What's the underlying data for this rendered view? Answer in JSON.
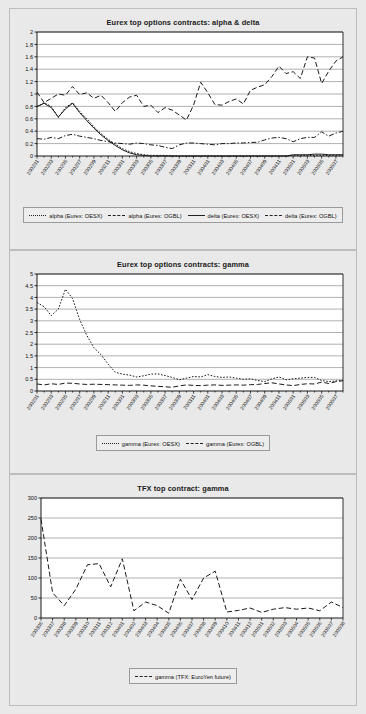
{
  "page": {
    "background": "#e9e9e9",
    "axis_color": "#000000",
    "grid_color": "#808080"
  },
  "figures": [
    {
      "id": "fig1",
      "title": "Eurex top options contracts: alpha & delta",
      "legend": [
        {
          "label": "alpha (Eurex: OESX)",
          "style": "dotted"
        },
        {
          "label": "alpha (Eurex: OGBL)",
          "style": "dashed"
        },
        {
          "label": "delta (Eurex: OESX)",
          "style": "solid"
        },
        {
          "label": "delta (Eurex: OGBL)",
          "style": "dashdot"
        }
      ],
      "chart_data": {
        "type": "line",
        "title": "Eurex top options contracts: alpha & delta",
        "xlabel": "",
        "ylabel": "",
        "ylim": [
          0,
          2
        ],
        "ytick_step": 0.2,
        "yticks": [
          0,
          0.2,
          0.4,
          0.6,
          0.8,
          1,
          1.2,
          1.4,
          1.6,
          1.8,
          2
        ],
        "grid": true,
        "legend_position": "bottom",
        "x": [
          "200201",
          "200202",
          "200203",
          "200204",
          "200205",
          "200206",
          "200207",
          "200208",
          "200209",
          "200210",
          "200211",
          "200212",
          "200301",
          "200302",
          "200303",
          "200304",
          "200305",
          "200306",
          "200307",
          "200308",
          "200309",
          "200310",
          "200311",
          "200312",
          "200401",
          "200402",
          "200403",
          "200404",
          "200405",
          "200406",
          "200407",
          "200408",
          "200409",
          "200410",
          "200411",
          "200412",
          "200501",
          "200502",
          "200503",
          "200504",
          "200505",
          "200506",
          "200507",
          "200508"
        ],
        "xticks": [
          "200201",
          "200203",
          "200205",
          "200207",
          "200209",
          "200211",
          "200301",
          "200303",
          "200305",
          "200307",
          "200309",
          "200311",
          "200401",
          "200403",
          "200405",
          "200407",
          "200409",
          "200411",
          "200501",
          "200503",
          "200505",
          "200507"
        ],
        "series": [
          {
            "name": "alpha (Eurex: OESX)",
            "style": "dotted",
            "values": [
              0.79,
              0.86,
              0.8,
              0.62,
              0.78,
              0.86,
              0.72,
              0.6,
              0.47,
              0.36,
              0.27,
              0.19,
              0.12,
              0.07,
              0.04,
              0.02,
              0.01,
              0.01,
              0.01,
              0.0,
              0.0,
              0.0,
              0.0,
              0.0,
              0.0,
              0.0,
              0.0,
              0.0,
              0.0,
              0.0,
              0.0,
              0.0,
              0.0,
              0.0,
              0.0,
              0.0,
              0.01,
              0.01,
              0.01,
              0.01,
              0.01,
              0.01,
              0.01,
              0.01
            ]
          },
          {
            "name": "alpha (Eurex: OGBL)",
            "style": "dashed",
            "values": [
              1.03,
              0.86,
              0.93,
              1.0,
              0.98,
              1.12,
              0.99,
              1.02,
              0.93,
              0.98,
              0.86,
              0.72,
              0.86,
              0.95,
              0.98,
              0.8,
              0.82,
              0.7,
              0.78,
              0.74,
              0.66,
              0.58,
              0.82,
              1.19,
              1.02,
              0.83,
              0.82,
              0.88,
              0.92,
              0.84,
              1.06,
              1.11,
              1.15,
              1.28,
              1.45,
              1.33,
              1.36,
              1.25,
              1.6,
              1.58,
              1.17,
              1.37,
              1.53,
              1.6
            ]
          },
          {
            "name": "delta (Eurex: OESX)",
            "style": "solid",
            "values": [
              0.8,
              0.85,
              0.78,
              0.63,
              0.76,
              0.85,
              0.7,
              0.57,
              0.45,
              0.34,
              0.25,
              0.17,
              0.1,
              0.05,
              0.02,
              0.01,
              0.0,
              0.0,
              0.0,
              0.0,
              0.0,
              0.0,
              0.0,
              0.0,
              0.0,
              0.0,
              0.0,
              0.0,
              0.0,
              0.0,
              0.0,
              0.0,
              0.0,
              0.0,
              0.0,
              0.0,
              0.02,
              0.02,
              0.02,
              0.03,
              0.03,
              0.02,
              0.02,
              0.02
            ]
          },
          {
            "name": "delta (Eurex: OGBL)",
            "style": "dashdot",
            "values": [
              0.28,
              0.27,
              0.3,
              0.28,
              0.33,
              0.35,
              0.32,
              0.3,
              0.28,
              0.25,
              0.23,
              0.21,
              0.2,
              0.19,
              0.21,
              0.2,
              0.18,
              0.17,
              0.14,
              0.12,
              0.18,
              0.21,
              0.21,
              0.2,
              0.19,
              0.18,
              0.2,
              0.2,
              0.21,
              0.21,
              0.22,
              0.22,
              0.26,
              0.29,
              0.3,
              0.28,
              0.23,
              0.28,
              0.3,
              0.3,
              0.39,
              0.32,
              0.37,
              0.4
            ]
          }
        ]
      }
    },
    {
      "id": "fig2",
      "title": "Eurex top options contracts: gamma",
      "legend": [
        {
          "label": "gamma (Eurex: OESX)",
          "style": "dotted"
        },
        {
          "label": "gamma (Eurex: OGBL)",
          "style": "dashed"
        }
      ],
      "chart_data": {
        "type": "line",
        "title": "Eurex top options contracts: gamma",
        "xlabel": "",
        "ylabel": "",
        "ylim": [
          0,
          5
        ],
        "ytick_step": 0.5,
        "yticks": [
          0,
          0.5,
          1,
          1.5,
          2,
          2.5,
          3,
          3.5,
          4,
          4.5,
          5
        ],
        "grid": true,
        "legend_position": "bottom",
        "x": [
          "200201",
          "200202",
          "200203",
          "200204",
          "200205",
          "200206",
          "200207",
          "200208",
          "200209",
          "200210",
          "200211",
          "200212",
          "200301",
          "200302",
          "200303",
          "200304",
          "200305",
          "200306",
          "200307",
          "200308",
          "200309",
          "200310",
          "200311",
          "200312",
          "200401",
          "200402",
          "200403",
          "200404",
          "200405",
          "200406",
          "200407",
          "200408",
          "200409",
          "200410",
          "200411",
          "200412",
          "200501",
          "200502",
          "200503",
          "200504",
          "200505",
          "200506",
          "200507",
          "200508"
        ],
        "xticks": [
          "200201",
          "200203",
          "200205",
          "200207",
          "200209",
          "200211",
          "200301",
          "200303",
          "200305",
          "200307",
          "200309",
          "200311",
          "200401",
          "200403",
          "200405",
          "200407",
          "200409",
          "200411",
          "200501",
          "200503",
          "200505",
          "200507"
        ],
        "series": [
          {
            "name": "gamma (Eurex: OESX)",
            "style": "dotted",
            "values": [
              3.78,
              3.6,
              3.22,
              3.5,
              4.35,
              3.95,
              3.05,
              2.38,
              1.85,
              1.55,
              1.15,
              0.8,
              0.72,
              0.68,
              0.6,
              0.65,
              0.72,
              0.73,
              0.66,
              0.58,
              0.48,
              0.55,
              0.62,
              0.6,
              0.7,
              0.62,
              0.58,
              0.6,
              0.55,
              0.5,
              0.52,
              0.45,
              0.4,
              0.52,
              0.6,
              0.48,
              0.52,
              0.55,
              0.58,
              0.58,
              0.45,
              0.4,
              0.43,
              0.45
            ]
          },
          {
            "name": "gamma (Eurex: OGBL)",
            "style": "dashed",
            "values": [
              0.3,
              0.26,
              0.31,
              0.28,
              0.34,
              0.33,
              0.3,
              0.28,
              0.29,
              0.28,
              0.27,
              0.26,
              0.25,
              0.24,
              0.26,
              0.25,
              0.22,
              0.2,
              0.18,
              0.16,
              0.22,
              0.26,
              0.24,
              0.23,
              0.25,
              0.26,
              0.24,
              0.25,
              0.26,
              0.25,
              0.27,
              0.28,
              0.32,
              0.35,
              0.3,
              0.26,
              0.23,
              0.28,
              0.31,
              0.3,
              0.38,
              0.32,
              0.4,
              0.44
            ]
          }
        ]
      }
    },
    {
      "id": "fig3",
      "title": "TFX top contract: gamma",
      "legend": [
        {
          "label": "gamma (TFX: EuroYen future)",
          "style": "dashed"
        }
      ],
      "chart_data": {
        "type": "line",
        "title": "TFX top contract: gamma",
        "xlabel": "",
        "ylabel": "",
        "ylim": [
          0,
          300
        ],
        "ytick_step": 50,
        "yticks": [
          0,
          50,
          100,
          150,
          200,
          250,
          300
        ],
        "grid": true,
        "legend_position": "bottom",
        "x": [
          "200306",
          "200307",
          "200308",
          "200309",
          "200310",
          "200311",
          "200312",
          "200401",
          "200402",
          "200403",
          "200404",
          "200405",
          "200406",
          "200407",
          "200408",
          "200409",
          "200410",
          "200411",
          "200412",
          "200501",
          "200502",
          "200503",
          "200504",
          "200505",
          "200506",
          "200507",
          "200508"
        ],
        "xticks": [
          "200306",
          "200307",
          "200308",
          "200309",
          "200310",
          "200311",
          "200312",
          "200401",
          "200402",
          "200403",
          "200404",
          "200405",
          "200406",
          "200407",
          "200408",
          "200409",
          "200410",
          "200411",
          "200412",
          "200501",
          "200502",
          "200503",
          "200504",
          "200505",
          "200506",
          "200507",
          "200508"
        ],
        "series": [
          {
            "name": "gamma (TFX: EuroYen future)",
            "style": "dashed",
            "values": [
              247,
              63,
              31,
              72,
              133,
              136,
              78,
              148,
              18,
              40,
              31,
              12,
              97,
              46,
              100,
              117,
              15,
              19,
              25,
              14,
              22,
              26,
              22,
              25,
              18,
              40,
              26
            ]
          }
        ]
      }
    }
  ]
}
